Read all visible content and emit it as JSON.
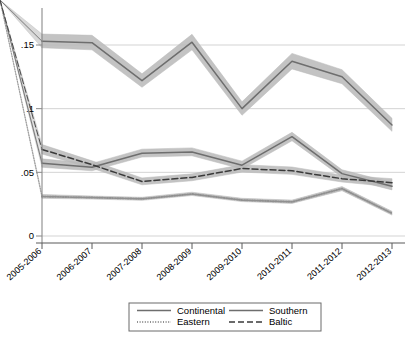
{
  "chart_data": {
    "type": "line",
    "title": "",
    "subtitle": "",
    "xlabel": "",
    "ylabel": "",
    "categories": [
      "2005-2006",
      "2006-2007",
      "2007-2008",
      "2008-2009",
      "2009-2010",
      "2010-2011",
      "2011-2012",
      "2012-2013"
    ],
    "ylim": [
      0,
      0.1843
    ],
    "yticks": [
      0,
      0.05,
      0.1,
      0.15
    ],
    "ytick_labels": [
      "0",
      ".05",
      ".1",
      ".15"
    ],
    "grid": "horizontal",
    "legend_position": "bottom",
    "ci_bands": true,
    "series": [
      {
        "name": "Continental",
        "style": "solid",
        "color": "#6e6e6e",
        "values": [
          0.153,
          0.1518,
          0.122,
          0.1522,
          0.1,
          0.1372,
          0.125,
          0.0872
        ],
        "ci_low": [
          0.1478,
          0.1462,
          0.1168,
          0.1462,
          0.0948,
          0.1312,
          0.1196,
          0.0822
        ],
        "ci_high": [
          0.1586,
          0.1576,
          0.1274,
          0.1584,
          0.1054,
          0.1434,
          0.1306,
          0.0924
        ]
      },
      {
        "name": "Southern",
        "style": "solid",
        "color": "#6e6e6e",
        "values": [
          0.0572,
          0.054,
          0.065,
          0.066,
          0.0556,
          0.078,
          0.049,
          0.039
        ],
        "ci_low": [
          0.054,
          0.0512,
          0.062,
          0.063,
          0.0526,
          0.0748,
          0.0462,
          0.0362
        ],
        "ci_high": [
          0.0606,
          0.057,
          0.0682,
          0.0692,
          0.0588,
          0.0814,
          0.052,
          0.042
        ]
      },
      {
        "name": "Eastern",
        "style": "dotted",
        "color": "#909090",
        "values": [
          0.031,
          0.0302,
          0.0292,
          0.033,
          0.0282,
          0.0268,
          0.0372,
          0.0178
        ],
        "ci_low": [
          0.0296,
          0.029,
          0.028,
          0.0318,
          0.027,
          0.0256,
          0.0356,
          0.0164
        ],
        "ci_high": [
          0.0326,
          0.0314,
          0.0304,
          0.0344,
          0.0296,
          0.0282,
          0.0388,
          0.0194
        ]
      },
      {
        "name": "Baltic",
        "style": "dashed",
        "color": "#3a3a3a",
        "values": [
          0.068,
          0.056,
          0.0428,
          0.046,
          0.053,
          0.0512,
          0.045,
          0.0418
        ],
        "ci_low": [
          0.0644,
          0.0532,
          0.0402,
          0.0434,
          0.0502,
          0.0484,
          0.0424,
          0.0386
        ],
        "ci_high": [
          0.0718,
          0.059,
          0.0456,
          0.0488,
          0.056,
          0.0542,
          0.0478,
          0.045
        ]
      }
    ]
  },
  "axis": {
    "y_tick_labels": [
      "0",
      ".05",
      ".1",
      ".15"
    ],
    "x_tick_labels": [
      "2005-2006",
      "2006-2007",
      "2007-2008",
      "2008-2009",
      "2009-2010",
      "2010-2011",
      "2011-2012",
      "2012-2013"
    ]
  },
  "legend": {
    "items": [
      {
        "label": "Continental",
        "style": "solid"
      },
      {
        "label": "Southern",
        "style": "solid"
      },
      {
        "label": "Eastern",
        "style": "dotted"
      },
      {
        "label": "Baltic",
        "style": "dashed"
      }
    ]
  },
  "colors": {
    "band": "#b9b9b9",
    "line_grey": "#6e6e6e",
    "line_dark": "#3a3a3a",
    "line_light": "#909090",
    "grid": "#c8c8c8",
    "axis": "#8a8a8a",
    "legend_border": "#6b6b6b"
  }
}
